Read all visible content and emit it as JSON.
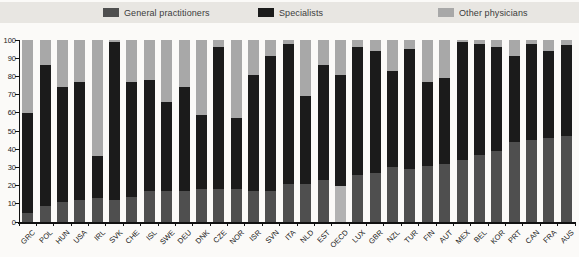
{
  "chart_data": {
    "type": "stacked-bar",
    "legend_position": "top",
    "grid": false,
    "ylim": [
      0,
      100
    ],
    "yticks": [
      0,
      10,
      20,
      30,
      40,
      50,
      60,
      70,
      80,
      90,
      100
    ],
    "ytick_labels": [
      "0",
      "10",
      "20",
      "30",
      "40",
      "50",
      "60",
      "70",
      "80",
      "90",
      "100"
    ],
    "categories": [
      "GRC",
      "POL",
      "HUN",
      "USA",
      "IRL",
      "SVK",
      "CHE",
      "ISL",
      "SWE",
      "DEU",
      "DNK",
      "CZE",
      "NOR",
      "ISR",
      "SVN",
      "ITA",
      "NLD",
      "EST",
      "OECD",
      "LUX",
      "GBR",
      "NZL",
      "TUR",
      "FIN",
      "AUT",
      "MEX",
      "BEL",
      "KOR",
      "PRT",
      "CAN",
      "FRA",
      "AUS"
    ],
    "series": [
      {
        "name": "General practitioners",
        "color": "#4f4f4f",
        "values": [
          5,
          9,
          11,
          12,
          13,
          12,
          14,
          17,
          17,
          17,
          18,
          18,
          18,
          17,
          17,
          21,
          21,
          23,
          20,
          26,
          27,
          30,
          29,
          31,
          32,
          34,
          37,
          39,
          44,
          45,
          46,
          47
        ]
      },
      {
        "name": "Specialists",
        "color": "#1b1b1b",
        "values": [
          55,
          77,
          63,
          65,
          23,
          87,
          63,
          61,
          49,
          57,
          41,
          78,
          39,
          64,
          74,
          77,
          48,
          63,
          61,
          70,
          67,
          53,
          66,
          46,
          47,
          65,
          61,
          57,
          47,
          53,
          48,
          50
        ]
      },
      {
        "name": "Other physicians",
        "color": "#a8a8a8",
        "values": [
          40,
          14,
          26,
          23,
          64,
          1,
          23,
          22,
          34,
          26,
          41,
          4,
          43,
          19,
          9,
          2,
          31,
          14,
          19,
          4,
          6,
          17,
          5,
          23,
          21,
          1,
          2,
          4,
          9,
          2,
          6,
          3
        ]
      }
    ],
    "highlight": {
      "category": "OECD",
      "series0_color": "#b2b2b2"
    }
  },
  "colors": {
    "legend_strip_bg": "#e8e6e2",
    "page_bg": "#fbfaf8",
    "axis": "#111111"
  }
}
